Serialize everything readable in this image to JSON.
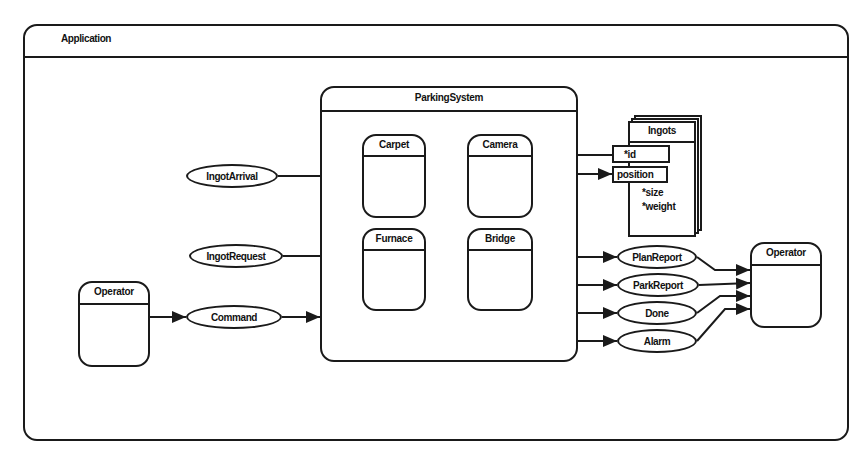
{
  "application": {
    "title": "Application"
  },
  "parking_system": {
    "title": "ParkingSystem",
    "components": [
      {
        "name": "Carpet"
      },
      {
        "name": "Camera"
      },
      {
        "name": "Furnace"
      },
      {
        "name": "Bridge"
      }
    ]
  },
  "ingots": {
    "title": "Ingots",
    "attributes": [
      "*id",
      "position",
      "*size",
      "*weight"
    ]
  },
  "inputs": {
    "flows": [
      "IngotArrival",
      "IngotRequest",
      "Command"
    ],
    "operator": "Operator"
  },
  "outputs": {
    "flows": [
      "PlanReport",
      "ParkReport",
      "Done",
      "Alarm"
    ],
    "operator": "Operator"
  },
  "colors": {
    "line": "#1a1a1a",
    "background": "#ffffff"
  }
}
